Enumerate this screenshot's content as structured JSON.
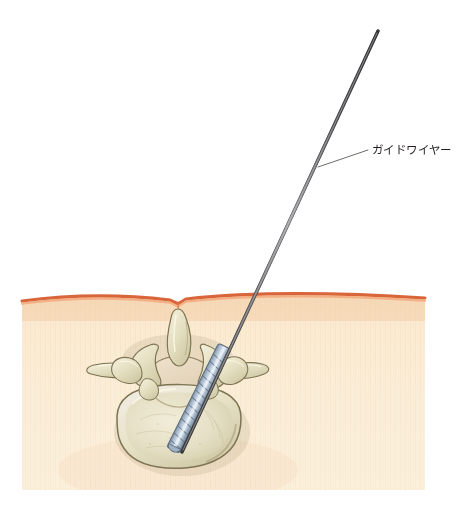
{
  "figure": {
    "view": "axial-cross-section",
    "width": 469,
    "height": 508,
    "background_color": "#ffffff"
  },
  "labels": [
    {
      "id": "guidewire",
      "text": "ガイドワイヤー",
      "text_color": "#231f20",
      "leader": {
        "from_x": 318,
        "from_y": 167,
        "to_x": 368,
        "to_y": 150,
        "color": "#6e6a66"
      },
      "text_x": 372,
      "text_y": 143
    }
  ],
  "structures": {
    "skin": {
      "name": "skin-surface-line",
      "line_color": "#e8845a",
      "line_highlight": "#f4b48c",
      "midline_dip_x": 178,
      "apex_y": 293
    },
    "soft_tissue": {
      "name": "subcutaneous-tissue-block",
      "fill_top": "#f9e7cf",
      "fill_bottom": "#fbefd9",
      "striation_color": "#f2dcbd",
      "left_x": 22,
      "right_x": 425,
      "bottom_y": 490
    },
    "vertebra": {
      "name": "lumbar-vertebra-axial",
      "bone_fill": "#e8e3c6",
      "bone_shadow": "#bfb894",
      "bone_outline": "#7d7353",
      "bone_highlight": "#f4f0dc",
      "parts": [
        "vertebral-body",
        "spinal-canal",
        "pedicle-left",
        "pedicle-right",
        "transverse-process-left",
        "transverse-process-right",
        "superior-articular-process-left",
        "superior-articular-process-right",
        "spinous-process",
        "lamina"
      ]
    },
    "guidewire": {
      "name": "guidewire-shaft",
      "color": "#4a4a4c",
      "highlight": "#9a9a9c",
      "tip_x": 378,
      "tip_y": 31,
      "skin_entry_x": 258,
      "skin_entry_y": 296,
      "end_x": 182,
      "end_y": 452
    },
    "cannula": {
      "name": "threaded-cannula",
      "fill": "#c3cfda",
      "shade": "#8fa3b4",
      "outline": "#5e6f7e",
      "thread_count": 14
    }
  }
}
